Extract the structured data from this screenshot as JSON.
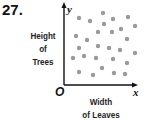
{
  "problem_number": "27.",
  "chart_data": {
    "type": "scatter",
    "title": "",
    "xlabel": "Width of Leaves",
    "ylabel": "Height of Trees",
    "x_axis_letter": "x",
    "y_axis_letter": "y",
    "origin_label": "O",
    "grid": false,
    "legend": null,
    "note": "No numeric scale; points show no correlation. Coordinates are pixel positions within the plot.",
    "points": [
      [
        79,
        18
      ],
      [
        90,
        21
      ],
      [
        103,
        13
      ],
      [
        113,
        19
      ],
      [
        128,
        17
      ],
      [
        104,
        24
      ],
      [
        98,
        32
      ],
      [
        112,
        32
      ],
      [
        121,
        29
      ],
      [
        135,
        26
      ],
      [
        76,
        36
      ],
      [
        87,
        40
      ],
      [
        127,
        39
      ],
      [
        79,
        48
      ],
      [
        98,
        46
      ],
      [
        109,
        48
      ],
      [
        120,
        50
      ],
      [
        135,
        53
      ],
      [
        73,
        58
      ],
      [
        84,
        56
      ],
      [
        96,
        58
      ],
      [
        113,
        59
      ],
      [
        127,
        63
      ],
      [
        79,
        72
      ],
      [
        93,
        75
      ],
      [
        102,
        68
      ],
      [
        114,
        73
      ],
      [
        125,
        74
      ]
    ],
    "point_color": "#9a9a9a"
  },
  "labels": {
    "y_line1": "Height",
    "y_line2": "of",
    "y_line3": "Trees",
    "x_line1": "Width",
    "x_line2": "of Leaves"
  }
}
